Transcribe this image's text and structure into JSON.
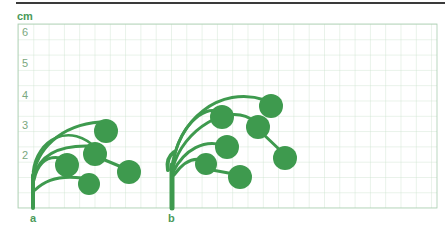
{
  "figure": {
    "unit": "cm",
    "y_axis_labels": [
      {
        "text": "6",
        "y": 26
      },
      {
        "text": "5",
        "y": 57
      },
      {
        "text": "4",
        "y": 89
      },
      {
        "text": "3",
        "y": 119
      },
      {
        "text": "2",
        "y": 149
      }
    ],
    "plant_labels": [
      {
        "text": "a",
        "x": 30
      },
      {
        "text": "b",
        "x": 168
      }
    ],
    "colors": {
      "plant": "#3e9a4e",
      "grid": "#c9e0cc",
      "grid_border": "#a9cdb0",
      "label": "#4a9a5a",
      "rule": "#3a3a3a"
    }
  }
}
